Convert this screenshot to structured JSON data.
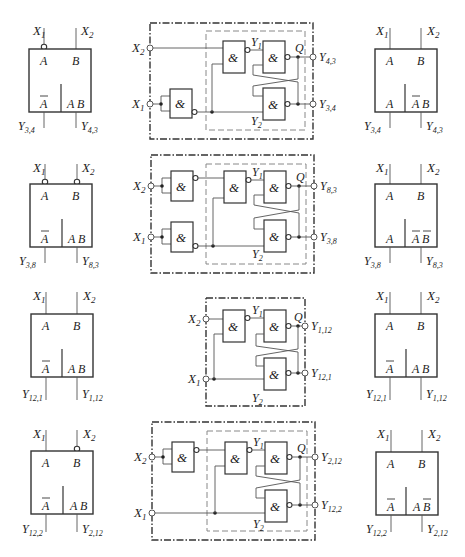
{
  "rows": [
    {
      "left_block": {
        "inputs": [
          "X1",
          "X2"
        ],
        "input_inverted": [
          true,
          false
        ],
        "top_labels": [
          "A",
          "B"
        ],
        "bottom_labels": [
          "Ā",
          "A B"
        ],
        "outputs": [
          "Y3,4",
          "Y4,3"
        ]
      },
      "circuit": {
        "inputs": [
          "X2",
          "X1"
        ],
        "outputs": [
          "Y4,3",
          "Y3,4"
        ],
        "internal": [
          "Y1",
          "Y2",
          "Q"
        ],
        "input_inverters": [
          false,
          true
        ],
        "gate_symbol": "&"
      },
      "right_block": {
        "inputs": [
          "X1",
          "X2"
        ],
        "top_labels": [
          "A",
          "B"
        ],
        "bottom_labels": [
          "A",
          "ĀB"
        ],
        "outputs": [
          "Y3,4",
          "Y4,3"
        ]
      }
    },
    {
      "left_block": {
        "inputs": [
          "X1",
          "X2"
        ],
        "input_inverted": [
          true,
          true
        ],
        "top_labels": [
          "A",
          "B"
        ],
        "bottom_labels": [
          "Ā",
          "A B"
        ],
        "outputs": [
          "Y3,8",
          "Y8,3"
        ]
      },
      "circuit": {
        "inputs": [
          "X2",
          "X1"
        ],
        "outputs": [
          "Y8,3",
          "Y3,8"
        ],
        "internal": [
          "Y1",
          "Y2",
          "Q"
        ],
        "input_inverters": [
          true,
          true
        ],
        "gate_symbol": "&"
      },
      "right_block": {
        "inputs": [
          "X1",
          "X2"
        ],
        "top_labels": [
          "A",
          "B"
        ],
        "bottom_labels": [
          "A",
          "Ā B̄"
        ],
        "outputs": [
          "Y3,8",
          "Y8,3"
        ]
      }
    },
    {
      "left_block": {
        "inputs": [
          "X1",
          "X2"
        ],
        "input_inverted": [
          false,
          false
        ],
        "top_labels": [
          "A",
          "B"
        ],
        "bottom_labels": [
          "Ā",
          "A B"
        ],
        "outputs": [
          "Y12,1",
          "Y1,12"
        ]
      },
      "circuit": {
        "inputs": [
          "X2",
          "X1"
        ],
        "outputs": [
          "Y1,12",
          "Y12,1"
        ],
        "internal": [
          "Y1",
          "Y2",
          "Q"
        ],
        "input_inverters": [
          false,
          false
        ],
        "gate_symbol": "&"
      },
      "right_block": {
        "inputs": [
          "X1",
          "X2"
        ],
        "top_labels": [
          "A",
          "B"
        ],
        "bottom_labels": [
          "Ā",
          "A B"
        ],
        "outputs": [
          "Y12,1",
          "Y1,12"
        ]
      }
    },
    {
      "left_block": {
        "inputs": [
          "X1",
          "X2"
        ],
        "input_inverted": [
          false,
          true
        ],
        "top_labels": [
          "A",
          "B"
        ],
        "bottom_labels": [
          "Ā",
          "A B"
        ],
        "outputs": [
          "Y12,2",
          "Y2,12"
        ]
      },
      "circuit": {
        "inputs": [
          "X2",
          "X1"
        ],
        "outputs": [
          "Y2,12",
          "Y12,2"
        ],
        "internal": [
          "Y1",
          "Y2",
          "Q"
        ],
        "input_inverters": [
          true,
          false
        ],
        "gate_symbol": "&"
      },
      "right_block": {
        "inputs": [
          "X1",
          "X2"
        ],
        "top_labels": [
          "A",
          "B"
        ],
        "bottom_labels": [
          "Ā",
          "A B̄"
        ],
        "outputs": [
          "Y12,2",
          "Y2,12"
        ]
      }
    }
  ],
  "labels": {
    "X1": "X",
    "X1_sub": "1",
    "X2": "X",
    "X2_sub": "2",
    "Y": "Y",
    "Y1_sub": "1",
    "Y2_sub": "2",
    "Q": "Q",
    "A": "A",
    "B": "B",
    "amp": "&",
    "out": {
      "r0a": "4,3",
      "r0b": "3,4",
      "r1a": "8,3",
      "r1b": "3,8",
      "r2a": "1,12",
      "r2b": "12,1",
      "r3a": "2,12",
      "r3b": "12,2"
    }
  }
}
